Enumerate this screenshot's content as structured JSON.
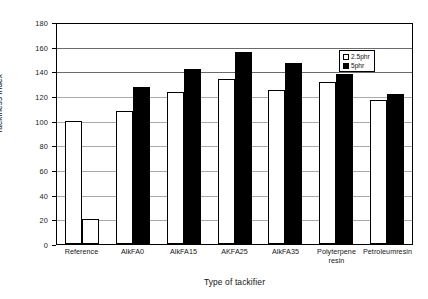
{
  "chart_data": {
    "type": "bar",
    "title": "",
    "xlabel": "Type of tackifier",
    "ylabel": "Tackiness index",
    "ylim": [
      0,
      180
    ],
    "ytick_step": 20,
    "yticks": [
      180,
      160,
      140,
      120,
      100,
      80,
      60,
      40,
      20,
      0
    ],
    "grid": true,
    "legend_position": "top-right",
    "categories": [
      "Reference",
      "AlkFA0",
      "AlkFA15",
      "AKFA25",
      "AlkFA35",
      "Polyterpene resin",
      "Petroleumresin"
    ],
    "series": [
      {
        "name": "2.5phr",
        "color": "#ffffff",
        "values": [
          100,
          108,
          123,
          134,
          125,
          131,
          117
        ]
      },
      {
        "name": "5phr",
        "color": "#000000",
        "values": [
          20,
          127,
          142,
          156,
          147,
          138,
          122
        ]
      }
    ]
  },
  "axes": {
    "y_title": "Tackiness index",
    "x_title": "Type of tackifier",
    "y_labels": [
      "180",
      "160",
      "140",
      "120",
      "100",
      "80",
      "60",
      "40",
      "20",
      "0"
    ]
  },
  "legend": {
    "items": [
      {
        "label": "2.5phr",
        "swatch": "white"
      },
      {
        "label": "5phr",
        "swatch": "black"
      }
    ]
  },
  "x_labels": [
    {
      "line1": "Reference",
      "line2": ""
    },
    {
      "line1": "AlkFA0",
      "line2": ""
    },
    {
      "line1": "AlkFA15",
      "line2": ""
    },
    {
      "line1": "AKFA25",
      "line2": ""
    },
    {
      "line1": "AlkFA35",
      "line2": ""
    },
    {
      "line1": "Polyterpene",
      "line2": "resin"
    },
    {
      "line1": "Petroleumresin",
      "line2": ""
    }
  ]
}
